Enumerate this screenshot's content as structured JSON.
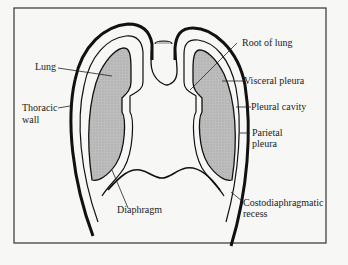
{
  "figure": {
    "colors": {
      "background": "#f7f7f5",
      "frame": "#333333",
      "lung_fill": "#b8b8b8",
      "outline": "#111111"
    },
    "labels": {
      "lung": "Lung",
      "thoracic_wall_1": "Thoracic",
      "thoracic_wall_2": "wall",
      "root_of_lung": "Root of lung",
      "visceral_pleura": "Visceral pleura",
      "pleural_cavity": "Pleural cavity",
      "parietal_pleura_1": "Parietal",
      "parietal_pleura_2": "pleura",
      "costodiaphragmatic_1": "Costodiaphragmatic",
      "costodiaphragmatic_2": "recess",
      "diaphragm": "Diaphragm"
    }
  }
}
